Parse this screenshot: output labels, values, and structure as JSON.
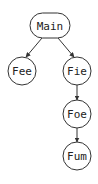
{
  "diagram": {
    "type": "call-tree",
    "nodes": [
      {
        "id": "main",
        "label": "Main"
      },
      {
        "id": "fee",
        "label": "Fee"
      },
      {
        "id": "fie",
        "label": "Fie"
      },
      {
        "id": "foe",
        "label": "Foe"
      },
      {
        "id": "fum",
        "label": "Fum"
      }
    ],
    "edges": [
      {
        "from": "Main",
        "to": "Fee"
      },
      {
        "from": "Main",
        "to": "Fie"
      },
      {
        "from": "Fie",
        "to": "Foe"
      },
      {
        "from": "Foe",
        "to": "Fum"
      }
    ]
  }
}
